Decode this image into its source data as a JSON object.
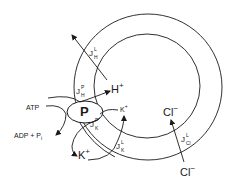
{
  "diagram": {
    "type": "membrane ion transport schematic",
    "pump": {
      "label": "P"
    },
    "reaction": {
      "substrate": "ATP",
      "products": "ADP + P",
      "products_subscript": "i"
    },
    "ions": {
      "h_inner": {
        "symbol": "H",
        "charge": "+"
      },
      "k_inner": {
        "symbol": "K",
        "charge": "+"
      },
      "k_outer": {
        "symbol": "K",
        "charge": "+"
      },
      "cl_inner": {
        "symbol": "Cl",
        "charge": "−"
      },
      "cl_outer": {
        "symbol": "Cl",
        "charge": "−"
      }
    },
    "fluxes": {
      "jhl": {
        "base": "J",
        "sup": "L",
        "sub": "H"
      },
      "jhp": {
        "base": "J",
        "sup": "P",
        "sub": "H"
      },
      "jkp": {
        "base": "J",
        "sup": "P",
        "sub": "K"
      },
      "jkl": {
        "base": "J",
        "sup": "L",
        "sub": "K"
      },
      "jcll": {
        "base": "J",
        "sup": "L",
        "sub": "Cl"
      }
    },
    "colors": {
      "ink": "#1a1a1a",
      "background": "#ffffff"
    }
  }
}
